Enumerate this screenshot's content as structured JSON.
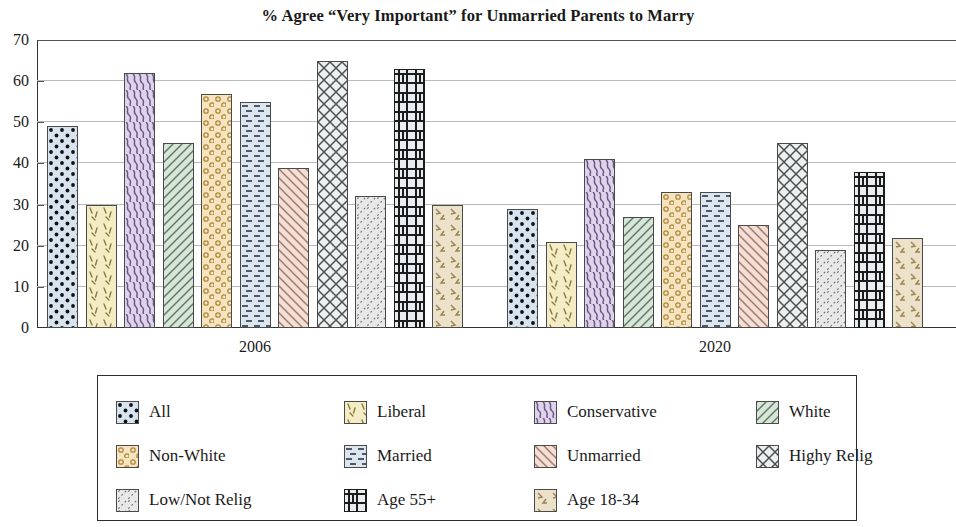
{
  "chart_data": {
    "type": "bar",
    "title": "% Agree “Very Important” for Unmarried Parents to Marry",
    "xlabel": "",
    "ylabel": "",
    "ylim": [
      0,
      70
    ],
    "yticks": [
      0,
      10,
      20,
      30,
      40,
      50,
      60,
      70
    ],
    "grid": true,
    "legend_position": "below",
    "categories": [
      "2006",
      "2020"
    ],
    "series": [
      {
        "name": "All",
        "values": [
          49,
          29
        ],
        "color": "#d7e4f0",
        "pattern": "dots"
      },
      {
        "name": "Liberal",
        "values": [
          30,
          21
        ],
        "color": "#f4ecc4",
        "pattern": "ticks"
      },
      {
        "name": "Conservative",
        "values": [
          62,
          41
        ],
        "color": "#ded3ea",
        "pattern": "squiggle"
      },
      {
        "name": "White",
        "values": [
          45,
          27
        ],
        "color": "#d8e6da",
        "pattern": "diagonal"
      },
      {
        "name": "Non-White",
        "values": [
          57,
          33
        ],
        "color": "#f6e3bf",
        "pattern": "circles"
      },
      {
        "name": "Married",
        "values": [
          55,
          33
        ],
        "color": "#dde5ef",
        "pattern": "dashes"
      },
      {
        "name": "Unmarried",
        "values": [
          39,
          25
        ],
        "color": "#f2e0d7",
        "pattern": "diagonal-back"
      },
      {
        "name": "Highy Relig",
        "values": [
          65,
          45
        ],
        "color": "#eaf1f0",
        "pattern": "crosshatch"
      },
      {
        "name": "Low/Not Relig",
        "values": [
          32,
          19
        ],
        "color": "#e8e8e8",
        "pattern": "dotted-diagonal"
      },
      {
        "name": "Age 55+",
        "values": [
          63,
          38
        ],
        "color": "#e8eef0",
        "pattern": "grid-heavy"
      },
      {
        "name": "Age 18-34",
        "values": [
          30,
          22
        ],
        "color": "#ece2ca",
        "pattern": "arrows"
      }
    ]
  },
  "legend": {
    "order": [
      "All",
      "Liberal",
      "Conservative",
      "White",
      "Non-White",
      "Married",
      "Unmarried",
      "Highy Relig",
      "Low/Not Relig",
      "Age 55+",
      "Age 18-34",
      ""
    ]
  }
}
